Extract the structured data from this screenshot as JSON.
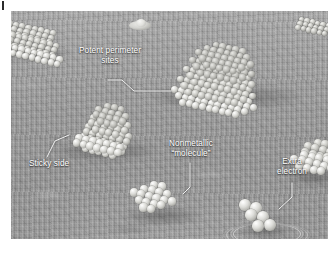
{
  "figure": {
    "alt_description": "Grayscale scientific illustration of metal nanoclusters on a textured substrate",
    "background_color": "#ffffff",
    "plate_color": "#9b9b9b",
    "label_color": "#ffffff"
  },
  "callouts": [
    {
      "id": "potent-perimeter-sites",
      "line1": "Potent perimeter",
      "line2": "sites",
      "x": 60,
      "y": 46
    },
    {
      "id": "sticky-side",
      "line1": "Sticky side",
      "line2": "",
      "x": 29,
      "y": 159
    },
    {
      "id": "nonmetallic-molecule",
      "line1": "Nonmetallic",
      "line2": "“molecule”",
      "x": 166,
      "y": 139
    },
    {
      "id": "extra-electron",
      "line1": "Extra",
      "line2": "electron",
      "x": 272,
      "y": 157
    }
  ],
  "clusters": [
    {
      "id": "cluster-top-left-edge",
      "description": "Partially cropped terraced cluster at upper left edge"
    },
    {
      "id": "cluster-distant-blob",
      "description": "Small faint distant cluster near top center"
    },
    {
      "id": "cluster-large-hexagonal",
      "description": "Large multi-layer hexagonal cluster with potent perimeter sites"
    },
    {
      "id": "cluster-stepped-left",
      "description": "Medium stepped cluster showing the sticky side facet"
    },
    {
      "id": "cluster-nonmetallic",
      "description": "Small single-layer nonmetallic molecule cluster"
    },
    {
      "id": "cluster-extra-electron",
      "description": "Six-atom cluster carrying an extra electron, surrounded by a ripple"
    },
    {
      "id": "cluster-right-edge",
      "description": "Cluster cropped at the right edge"
    },
    {
      "id": "cluster-top-right-edge",
      "description": "Small cluster fragment at the top right edge"
    }
  ]
}
